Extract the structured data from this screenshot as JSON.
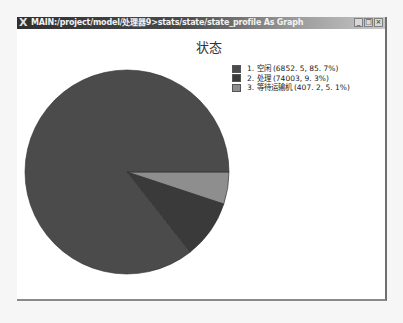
{
  "window": {
    "title": "MAIN:/project/model/处理器9>stats/state/state_profile As Graph",
    "logo_icon": "X",
    "buttons": {
      "minimize": "_",
      "maximize": "□",
      "close": "×"
    }
  },
  "chart_data": {
    "type": "pie",
    "title": "状态",
    "legend_position": "right",
    "categories": [
      "空闲",
      "处理",
      "等待运输机"
    ],
    "values": [
      6852.5,
      740.03,
      407.2
    ],
    "percentages": [
      85.7,
      9.3,
      5.1
    ],
    "legend_labels": [
      "1. 空闲 (6852. 5, 85. 7%)",
      "2. 处理 (74003, 9. 3%)",
      "3. 等待运输机 (407. 2, 5. 1%)"
    ],
    "colors": [
      "#4b4b4b",
      "#3a3a3a",
      "#8e8e8e"
    ]
  }
}
